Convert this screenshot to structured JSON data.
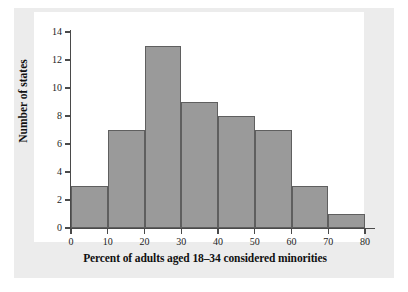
{
  "figure": {
    "background_color": "#ececec",
    "panel_color": "#ffffff",
    "bar_fill_color": "#9a9a9a",
    "bar_edge_color": "#5f5f5f",
    "axis_color": "#4a4a4a"
  },
  "chart_data": {
    "type": "bar",
    "title": "",
    "xlabel": "Percent of adults aged 18–34 considered minorities",
    "ylabel": "Number of states",
    "categories": [
      "0–10",
      "10–20",
      "20–30",
      "30–40",
      "40–50",
      "50–60",
      "60–70",
      "70–80"
    ],
    "bin_edges": [
      0,
      10,
      20,
      30,
      40,
      50,
      60,
      70,
      80
    ],
    "bin_width": 10,
    "values": [
      3,
      7,
      13,
      9,
      8,
      7,
      3,
      1
    ],
    "total_count": 51,
    "xlim": [
      0,
      80
    ],
    "ylim": [
      0,
      14
    ],
    "xticks": [
      0,
      10,
      20,
      30,
      40,
      50,
      60,
      70,
      80
    ],
    "yticks": [
      0,
      2,
      4,
      6,
      8,
      10,
      12,
      14
    ],
    "xtick_labels": [
      "0",
      "10",
      "20",
      "30",
      "40",
      "50",
      "60",
      "70",
      "80"
    ],
    "ytick_labels": [
      "0",
      "2",
      "4",
      "6",
      "8",
      "10",
      "12",
      "14"
    ],
    "grid": false,
    "legend": null,
    "legend_position": "none",
    "annotations": []
  }
}
